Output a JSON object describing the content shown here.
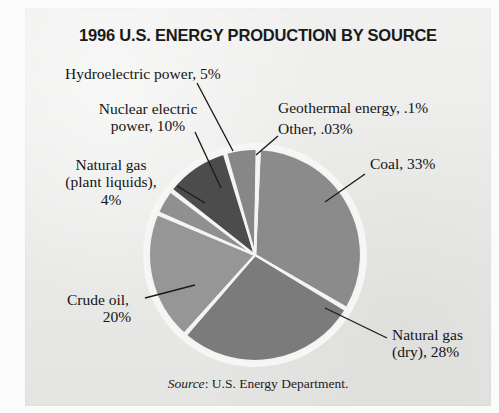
{
  "figure": {
    "title": "1996 U.S. ENERGY PRODUCTION BY SOURCE",
    "source_word": "Source",
    "source_rest": ": U.S. Energy Department.",
    "panel_color": "#e9e9e7",
    "page_color": "#ffffff"
  },
  "labels": {
    "hydro": "Hydroelectric power, 5%",
    "nuclear_line1": "Nuclear electric",
    "nuclear_line2": "power, 10%",
    "plant_gas_line1": "Natural gas",
    "plant_gas_line2": "(plant liquids),",
    "plant_gas_line3": "4%",
    "geothermal": "Geothermal energy, .1%",
    "other": "Other, .03%",
    "coal": "Coal, 33%",
    "crude_line1": "Crude oil,",
    "crude_line2": "20%",
    "natgas_dry_line1": "Natural gas",
    "natgas_dry_line2": "(dry), 28%"
  },
  "chart_data": {
    "type": "pie",
    "title": "1996 U.S. ENERGY PRODUCTION BY SOURCE",
    "subtitle": "",
    "source": "Source: U.S. Energy Department.",
    "units": "percent of total U.S. energy production",
    "legend": "none (direct labels with leader lines)",
    "grid": false,
    "total_percent": 100.13,
    "start_angle_deg": -88,
    "direction": "clockwise",
    "separator_color": "#f4f4f2",
    "slices": [
      {
        "name": "Coal",
        "label": "Coal, 33%",
        "value": 33,
        "color": "#8b8b8b",
        "label_position": "right"
      },
      {
        "name": "Natural gas (dry)",
        "label": "Natural gas (dry), 28%",
        "value": 28,
        "color": "#7b7b7b",
        "label_position": "bottom-right"
      },
      {
        "name": "Crude oil",
        "label": "Crude oil, 20%",
        "value": 20,
        "color": "#969696",
        "label_position": "bottom-left"
      },
      {
        "name": "Natural gas (plant liquids)",
        "label": "Natural gas (plant liquids), 4%",
        "value": 4,
        "color": "#909090",
        "label_position": "left"
      },
      {
        "name": "Nuclear electric power",
        "label": "Nuclear electric power, 10%",
        "value": 10,
        "color": "#4c4c4c",
        "label_position": "upper-left"
      },
      {
        "name": "Hydroelectric power",
        "label": "Hydroelectric power, 5%",
        "value": 5,
        "color": "#878787",
        "label_position": "top"
      },
      {
        "name": "Geothermal energy",
        "label": "Geothermal energy, .1%",
        "value": 0.1,
        "color": "#8b8b8b",
        "label_position": "upper-right"
      },
      {
        "name": "Other",
        "label": "Other, .03%",
        "value": 0.03,
        "color": "#8b8b8b",
        "label_position": "upper-right"
      }
    ]
  }
}
